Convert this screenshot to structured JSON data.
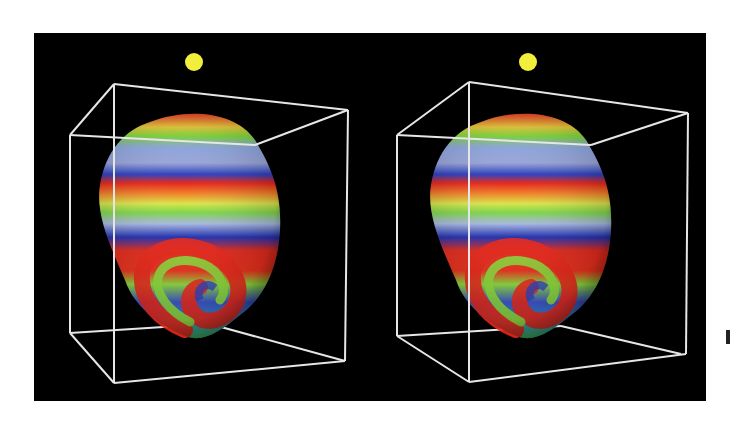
{
  "figure": {
    "background_color": "#000000",
    "box_color": "#e8e8e8",
    "light_source_color": "#f2ef3c",
    "color_scale": [
      "#e8261a",
      "#f07a1e",
      "#e9e23a",
      "#7fd93a",
      "#37b84a",
      "#3a6fd6",
      "#1f2fb0",
      "#8a8ad8"
    ],
    "views": [
      {
        "name": "left-eye-view",
        "offset_x": 0
      },
      {
        "name": "right-eye-view",
        "offset_x": 331
      }
    ]
  }
}
